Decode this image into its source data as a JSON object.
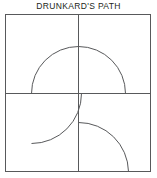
{
  "block": {
    "title": "DRUNKARD'S PATH",
    "type": "quilt-block-diagram",
    "background_color": "#ffffff",
    "line_color": "#58595b",
    "frame": {
      "x": 5,
      "y": 2,
      "width": 146,
      "height": 158,
      "stroke_width": 1
    },
    "grid": {
      "rows": 2,
      "columns": 2,
      "center_x": 78,
      "center_y": 81,
      "vertical_divider": {
        "x": 78,
        "y1": 2,
        "y2": 160
      },
      "horizontal_divider": {
        "y": 81,
        "x1": 5,
        "x2": 151
      }
    },
    "quadrants": [
      {
        "name": "top-left",
        "arc_label": "large-quarter-arc-corner-bottom-right",
        "center_x": 78,
        "center_y": 81,
        "radius": 47,
        "start_angle_deg": 180,
        "end_angle_deg": 270,
        "path": "M 31 81 A 47 47 0 0 1 78 34"
      },
      {
        "name": "top-right",
        "arc_label": "large-quarter-arc-corner-bottom-right",
        "center_x": 78,
        "center_y": 81,
        "radius": 47,
        "start_angle_deg": 270,
        "end_angle_deg": 360,
        "path": "M 78 34 A 47 47 0 0 1 125 81"
      },
      {
        "name": "bottom-left",
        "arc_label": "large-quarter-arc-corner-top-left",
        "center_x": 31,
        "center_y": 81,
        "radius": 50,
        "start_angle_deg": 0,
        "end_angle_deg": 90,
        "path": "M 81 81 A 50 50 0 0 1 31 131"
      },
      {
        "name": "bottom-right",
        "arc_label": "small-quarter-arc-corner-top-left",
        "center_x": 78,
        "center_y": 160,
        "radius": 50,
        "start_angle_deg": 270,
        "end_angle_deg": 360,
        "path": "M 78 110 A 50 50 0 0 1 128 160"
      }
    ]
  }
}
